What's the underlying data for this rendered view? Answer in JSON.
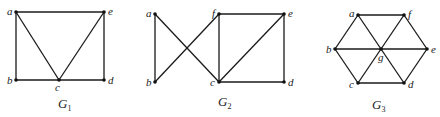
{
  "graphs": [
    {
      "name": "G",
      "subscript": "1",
      "vertices": [
        "a",
        "b",
        "c",
        "d",
        "e"
      ],
      "edges": [
        [
          "a",
          "e"
        ],
        [
          "a",
          "b"
        ],
        [
          "a",
          "c"
        ],
        [
          "e",
          "c"
        ],
        [
          "e",
          "d"
        ],
        [
          "b",
          "c"
        ],
        [
          "c",
          "d"
        ]
      ]
    },
    {
      "name": "G",
      "subscript": "2",
      "vertices": [
        "a",
        "b",
        "c",
        "d",
        "e",
        "f"
      ],
      "edges": [
        [
          "a",
          "b"
        ],
        [
          "a",
          "c"
        ],
        [
          "b",
          "f"
        ],
        [
          "f",
          "e"
        ],
        [
          "f",
          "c"
        ],
        [
          "c",
          "e"
        ],
        [
          "e",
          "d"
        ],
        [
          "c",
          "d"
        ]
      ]
    },
    {
      "name": "G",
      "subscript": "3",
      "vertices": [
        "a",
        "b",
        "c",
        "d",
        "e",
        "f",
        "g"
      ],
      "edges": [
        [
          "a",
          "f"
        ],
        [
          "a",
          "b"
        ],
        [
          "a",
          "g"
        ],
        [
          "f",
          "g"
        ],
        [
          "f",
          "e"
        ],
        [
          "b",
          "g"
        ],
        [
          "g",
          "e"
        ],
        [
          "b",
          "c"
        ],
        [
          "g",
          "c"
        ],
        [
          "g",
          "d"
        ],
        [
          "e",
          "d"
        ],
        [
          "c",
          "d"
        ]
      ]
    }
  ]
}
